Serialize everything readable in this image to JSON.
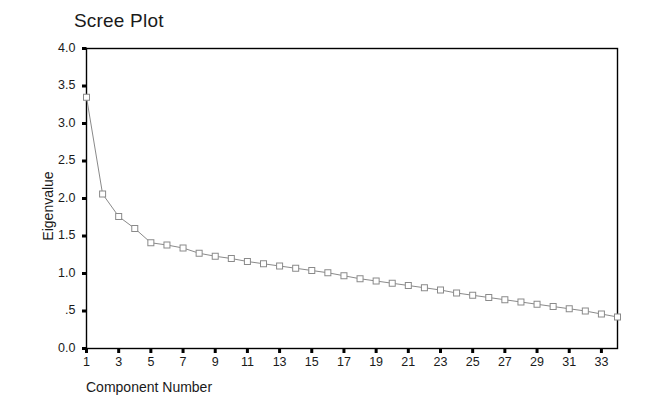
{
  "chart_data": {
    "type": "line",
    "title": "Scree Plot",
    "xlabel": "Component Number",
    "ylabel": "Eigenvalue",
    "xlim": [
      1,
      34
    ],
    "ylim": [
      0.0,
      4.0
    ],
    "grid": false,
    "legend": null,
    "marker": "open-square",
    "line_color": "#8a8a8a",
    "marker_color": "#8a8a8a",
    "frame_color": "#000000",
    "y_ticks": [
      0.0,
      0.5,
      1.0,
      1.5,
      2.0,
      2.5,
      3.0,
      3.5,
      4.0
    ],
    "y_tick_labels": [
      "0.0",
      ".5",
      "1.0",
      "1.5",
      "2.0",
      "2.5",
      "3.0",
      "3.5",
      "4.0"
    ],
    "x_ticks": [
      1,
      3,
      5,
      7,
      9,
      11,
      13,
      15,
      17,
      19,
      21,
      23,
      25,
      27,
      29,
      31,
      33
    ],
    "x_tick_labels": [
      "1",
      "3",
      "5",
      "7",
      "9",
      "11",
      "13",
      "15",
      "17",
      "19",
      "21",
      "23",
      "25",
      "27",
      "29",
      "31",
      "33"
    ],
    "x": [
      1,
      2,
      3,
      4,
      5,
      6,
      7,
      8,
      9,
      10,
      11,
      12,
      13,
      14,
      15,
      16,
      17,
      18,
      19,
      20,
      21,
      22,
      23,
      24,
      25,
      26,
      27,
      28,
      29,
      30,
      31,
      32,
      33,
      34
    ],
    "values": [
      3.35,
      2.06,
      1.76,
      1.6,
      1.41,
      1.38,
      1.34,
      1.27,
      1.23,
      1.2,
      1.16,
      1.13,
      1.1,
      1.07,
      1.04,
      1.01,
      0.97,
      0.93,
      0.9,
      0.87,
      0.84,
      0.81,
      0.78,
      0.74,
      0.71,
      0.68,
      0.65,
      0.62,
      0.59,
      0.56,
      0.53,
      0.5,
      0.46,
      0.42
    ],
    "series": [
      {
        "name": "Eigenvalue",
        "values": [
          3.35,
          2.06,
          1.76,
          1.6,
          1.41,
          1.38,
          1.34,
          1.27,
          1.23,
          1.2,
          1.16,
          1.13,
          1.1,
          1.07,
          1.04,
          1.01,
          0.97,
          0.93,
          0.9,
          0.87,
          0.84,
          0.81,
          0.78,
          0.74,
          0.71,
          0.68,
          0.65,
          0.62,
          0.59,
          0.56,
          0.53,
          0.5,
          0.46,
          0.42
        ]
      }
    ]
  }
}
